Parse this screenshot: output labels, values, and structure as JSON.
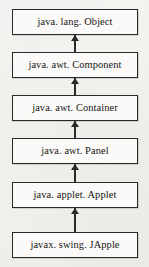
{
  "diagram": {
    "type": "class-inheritance-hierarchy",
    "title": "",
    "orientation": "vertical-bottom-to-top",
    "arrow_direction": "up",
    "colors": {
      "background": "#f1f0ed",
      "box_fill": "#fbfaf8",
      "box_border": "#2b2a28",
      "text": "#161513",
      "arrow": "#2b2a28"
    },
    "nodes": [
      {
        "label": "java. lang. Object",
        "top": 9,
        "index": 0
      },
      {
        "label": "java. awt. Component",
        "top": 52,
        "index": 1
      },
      {
        "label": "java. awt. Container",
        "top": 95,
        "index": 2
      },
      {
        "label": "java. awt. Panel",
        "top": 138,
        "index": 3
      },
      {
        "label": "java. applet. Applet",
        "top": 182,
        "index": 4
      },
      {
        "label": "javax. swing. JApple",
        "top": 232,
        "index": 5
      }
    ],
    "edges": [
      {
        "from": "java. awt. Component",
        "to": "java. lang. Object",
        "top": 35,
        "height": 17
      },
      {
        "from": "java. awt. Container",
        "to": "java. awt. Component",
        "top": 78,
        "height": 17
      },
      {
        "from": "java. awt. Panel",
        "to": "java. awt. Container",
        "top": 121,
        "height": 17
      },
      {
        "from": "java. applet. Applet",
        "to": "java. awt. Panel",
        "top": 164,
        "height": 18
      },
      {
        "from": "javax. swing. JApple",
        "to": "java. applet. Applet",
        "top": 208,
        "height": 24
      }
    ]
  }
}
